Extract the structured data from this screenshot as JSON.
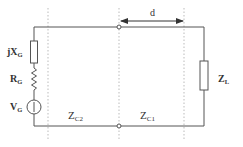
{
  "diagram": {
    "type": "transmission-line-circuit",
    "source": {
      "reactance_label": "jX",
      "reactance_sub": "G",
      "resistance_label": "R",
      "resistance_sub": "G",
      "voltage_label": "V",
      "voltage_sub": "G"
    },
    "sections": [
      {
        "label": "Z",
        "sub": "C2"
      },
      {
        "label": "Z",
        "sub": "C1"
      }
    ],
    "load": {
      "label": "Z",
      "sub": "L"
    },
    "dimension": {
      "label": "d"
    },
    "colors": {
      "wire": "#555555",
      "dotted": "#aaaaaa",
      "text": "#333333"
    }
  }
}
